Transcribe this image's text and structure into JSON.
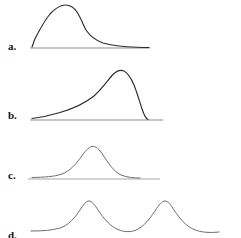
{
  "figure": {
    "background_color": "#ffffff",
    "curve_color": "#2b2b2b",
    "light_curve_color": "#6d6d6d",
    "baseline_color": "#a8a8a8",
    "label_color": "#141414",
    "width": 241,
    "height": 238
  },
  "panels": [
    {
      "label": "a.",
      "shape": "right-skewed",
      "label_x": 8,
      "label_y": 41,
      "baseline": {
        "x1": 30,
        "x2": 150,
        "y": 48
      },
      "curve": "M32,47 C33.5,42 35.5,37 38,33 C41,27.5 45,20 50,14 C55,8.5 60,5.5 65,5 C70,4.8 74,7.5 77,12 C80.5,17.5 83,24 86,30 C90,36 96,40.5 103,43 C112,45.8 124,46.8 137,47.2 C142,47.4 146,47.5 149,47.5",
      "stroke": "dark"
    },
    {
      "label": "b.",
      "shape": "left-skewed",
      "label_x": 8,
      "label_y": 110,
      "baseline": {
        "x1": 30,
        "x2": 163,
        "y": 120
      },
      "curve": "M32,118.5 C40,117.5 50,115.5 60,112.5 C72,109 84,104 94,96 C102,89 108,80 113,74.5 C117,70.5 120.5,69.5 124,71 C128,73 131,78 134,85 C137,92.5 139.5,101 142,109 C144,115 146,118.5 148,119.5",
      "stroke": "dark"
    },
    {
      "label": "c.",
      "shape": "symmetric-normal",
      "label_x": 8,
      "label_y": 170,
      "baseline": {
        "x1": 28,
        "x2": 160,
        "y": 179
      },
      "curve": "M32,177.5 C44,177.2 54,176.8 62,174 C70,171 76,164 81,157 C85,151.5 88,147.5 92,146.5 C96,145.8 99,149 103,155 C108,162.5 113,171 121,175 C127,177.5 134,178 140,178",
      "stroke": "light"
    },
    {
      "label": "d.",
      "shape": "bimodal",
      "label_x": 8,
      "label_y": 230,
      "baseline": null,
      "curve": "M31,231 C42,231 52,230.5 60,228 C68,225.5 74,219 80,210 C83.5,204.5 86,201 89,201 C92,201 94.5,204.5 98,210 C104,219 110,226 118,229.5 C124,232 130,232.5 136,230 C143,227 149,220 155,211 C159,204.5 162,201 165,201 C168,201 170.5,204.5 174,210 C180,219 186,226 194,229.5 C201,232.5 210,233 219,232",
      "stroke": "light"
    }
  ]
}
